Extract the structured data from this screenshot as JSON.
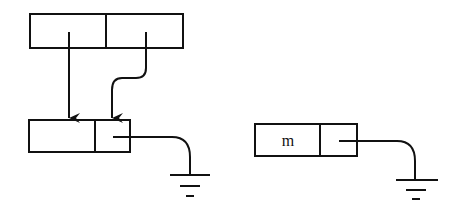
{
  "diagram": {
    "type": "linked-list-memory-diagram",
    "colors": {
      "stroke": "#111111",
      "background": "#ffffff"
    },
    "nodes": [
      {
        "id": "top-pair",
        "cells": [
          "",
          ""
        ],
        "x": 30,
        "y": 14,
        "w": 153,
        "h": 34,
        "divider_x": 106
      },
      {
        "id": "left-node",
        "cells": [
          "",
          ""
        ],
        "x": 29,
        "y": 120,
        "w": 101,
        "h": 32,
        "divider_x": 95
      },
      {
        "id": "right-node",
        "cells": [
          "m",
          ""
        ],
        "x": 255,
        "y": 124,
        "w": 102,
        "h": 32,
        "divider_x": 320
      }
    ],
    "arrows": [
      {
        "from": "top-pair.cell0",
        "to": "left-node.cell0",
        "style": "straight"
      },
      {
        "from": "top-pair.cell1",
        "to": "left-node.cell1",
        "style": "s-curve"
      }
    ],
    "ground_pointers": [
      {
        "from": "left-node.cell1",
        "symbol": "ground"
      },
      {
        "from": "right-node.cell1",
        "symbol": "ground"
      }
    ],
    "labels": {
      "right_node_value": "m"
    }
  }
}
